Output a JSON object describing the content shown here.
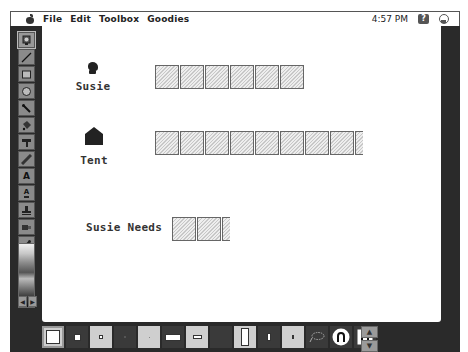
{
  "menubar": {
    "apple_icon": "apple-icon",
    "items": [
      "File",
      "Edit",
      "Toolbox",
      "Goodies"
    ],
    "clock": "4:57 PM",
    "help_icon_glyph": "?",
    "app_icon": "app-menu-icon"
  },
  "toolbox": {
    "tools": [
      {
        "name": "brush-tool",
        "glyph": "",
        "selected": true
      },
      {
        "name": "line-tool",
        "glyph": ""
      },
      {
        "name": "rectangle-tool",
        "glyph": ""
      },
      {
        "name": "oval-tool",
        "glyph": ""
      },
      {
        "name": "paintbrush-tool",
        "glyph": ""
      },
      {
        "name": "paint-bucket-tool",
        "glyph": ""
      },
      {
        "name": "eraser-tool",
        "glyph": ""
      },
      {
        "name": "crayon-tool",
        "glyph": ""
      },
      {
        "name": "text-tool",
        "glyph": "A"
      },
      {
        "name": "text-stamp-tool",
        "glyph": "A"
      },
      {
        "name": "stamp-tool",
        "glyph": ""
      },
      {
        "name": "sprayer-tool",
        "glyph": ""
      },
      {
        "name": "eyedropper-tool",
        "glyph": ""
      },
      {
        "name": "color-wheel-tool",
        "glyph": ""
      }
    ],
    "palette_arrows": [
      "◀",
      "▶"
    ]
  },
  "canvas": {
    "rows": [
      {
        "label": "Susie",
        "icon": "susie-head-icon",
        "units": 6,
        "partial": false
      },
      {
        "label": "Tent",
        "icon": "tent-icon",
        "units": 8,
        "partial": true
      },
      {
        "label": "Susie Needs",
        "icon": null,
        "units": 2,
        "partial": true
      }
    ]
  },
  "bottombar": {
    "options": [
      "brush-size-large",
      "brush-size-medium",
      "brush-size-small",
      "brush-size-tiny",
      "brush-size-dot",
      "wide-rect",
      "small-rect",
      "tall-rect",
      "narrow-rect",
      "thin-rect",
      "lasso",
      "magnet-round",
      "magnet-square"
    ],
    "scroll_up": "▲",
    "scroll_down": "▼"
  }
}
